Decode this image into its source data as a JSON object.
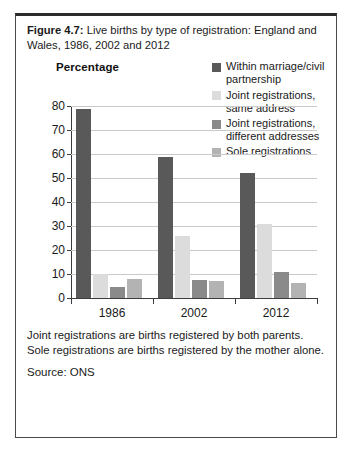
{
  "figure": {
    "number": "Figure 4.7:",
    "caption": " Live births by type of registration: England and Wales, 1986, 2002 and 2012",
    "footnote": "Joint registrations are births registered by both parents. Sole registrations are births registered by the mother alone.",
    "source": "Source: ONS"
  },
  "chart_data": {
    "type": "bar",
    "title": "Live births by type of registration: England and Wales, 1986, 2002 and 2012",
    "xlabel": "",
    "ylabel": "Percentage",
    "ylim": [
      0,
      80
    ],
    "yticks": [
      0,
      10,
      20,
      30,
      40,
      50,
      60,
      70,
      80
    ],
    "ytick_labels": [
      "0",
      "10",
      "20",
      "30",
      "40",
      "50",
      "60",
      "70",
      "80"
    ],
    "categories": [
      "1986",
      "2002",
      "2012"
    ],
    "grid": true,
    "legend_position": "top-right",
    "series": [
      {
        "name": "Within marriage/civil partnership",
        "color": "#595959",
        "values": [
          79,
          59,
          52
        ]
      },
      {
        "name": "Joint registrations, same address",
        "color": "#dcdcdc",
        "values": [
          10,
          26,
          31
        ]
      },
      {
        "name": "Joint registrations, different addresses",
        "color": "#8a8a8a",
        "values": [
          4.5,
          7.5,
          11
        ]
      },
      {
        "name": "Sole registrations",
        "color": "#b3b3b3",
        "values": [
          8,
          7,
          6.5
        ]
      }
    ]
  }
}
